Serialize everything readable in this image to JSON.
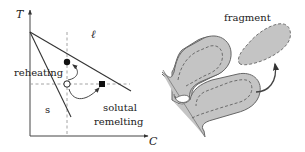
{
  "left_panel": {
    "title": "phase diagram",
    "y_axis_label": "T",
    "x_axis_label": "C",
    "region_liquid": "ℓ",
    "region_solid": "s",
    "annotation_reheating": "reheating",
    "annotation_solutal_1": "solutal",
    "annotation_solutal_2": "remelting",
    "markers": {
      "initial_state": "open-circle",
      "after_reheating": "filled-circle",
      "after_solutal_remelting": "filled-square"
    }
  },
  "right_panel": {
    "title": "dendrite fragmentation",
    "fragment_label": "fragment"
  },
  "colors": {
    "line": "#333333",
    "dashed": "#999999",
    "dendrite_fill": "#c4c4c4",
    "dendrite_stroke": "#666666",
    "arrow": "#444444"
  }
}
